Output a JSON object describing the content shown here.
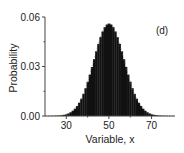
{
  "chart_data": {
    "type": "bar",
    "title": "",
    "panel_label": "(d)",
    "xlabel": "Variable, x",
    "ylabel": "Probability",
    "xlim": [
      20,
      81
    ],
    "ylim": [
      0,
      0.06
    ],
    "x_ticks": [
      30,
      50,
      70
    ],
    "x_tick_labels": [
      "30",
      "50",
      "70"
    ],
    "y_ticks": [
      0.0,
      0.03,
      0.06
    ],
    "y_tick_labels": [
      "0.00",
      "0.03",
      "0.06"
    ],
    "grid": false,
    "legend": null,
    "series": [
      {
        "name": "Probability distribution",
        "distribution": "approximately normal (binomial-like)",
        "mean": 50,
        "std": 7.1,
        "peak_value": 0.056,
        "color": "#111111",
        "x": [
          25,
          30,
          35,
          40,
          45,
          50,
          55,
          60,
          65,
          70,
          75
        ],
        "values": [
          0.0011,
          0.0054,
          0.0164,
          0.0307,
          0.0437,
          0.0562,
          0.0437,
          0.0307,
          0.0164,
          0.0054,
          0.0011
        ]
      }
    ]
  }
}
